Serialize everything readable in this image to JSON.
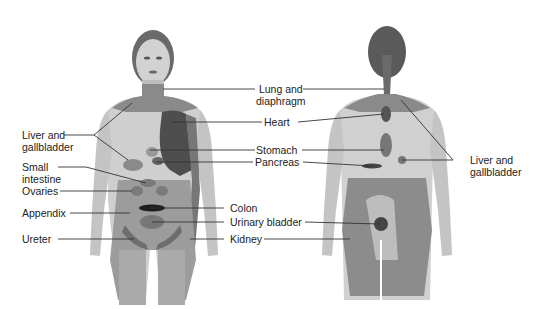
{
  "diagram": {
    "type": "referred-pain-map",
    "views": [
      "front",
      "back"
    ],
    "colors": {
      "skin": "#bdbdbd",
      "skin_light": "#d6d6d6",
      "zone": "#8a8a8a",
      "zone_dark": "#5e5e5e",
      "organ_dark": "#3a3a3a",
      "line": "#333333"
    },
    "labels": {
      "liver_gallbladder_left": [
        "Liver and",
        "gallbladder"
      ],
      "small_intestine": [
        "Small",
        "intestine"
      ],
      "ovaries": "Ovaries",
      "appendix": "Appendix",
      "ureter": "Ureter",
      "lung_diaphragm": [
        "Lung and",
        "diaphragm"
      ],
      "heart": "Heart",
      "stomach": "Stomach",
      "pancreas": "Pancreas",
      "colon": "Colon",
      "urinary_bladder": "Urinary bladder",
      "kidney": "Kidney",
      "liver_gallbladder_right": [
        "Liver and",
        "gallbladder"
      ]
    }
  }
}
